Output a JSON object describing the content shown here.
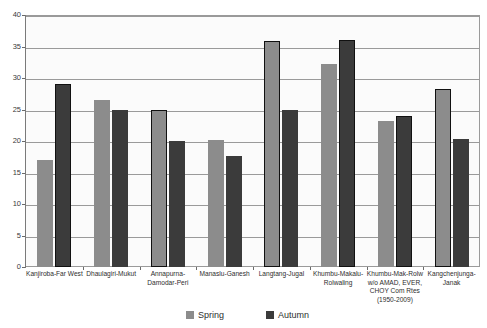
{
  "chart_data": {
    "type": "bar",
    "title": "",
    "subtitle": "",
    "xlabel": "",
    "ylabel": "",
    "ylim": [
      0,
      40
    ],
    "yticks": [
      0,
      5,
      10,
      15,
      20,
      25,
      30,
      35,
      40
    ],
    "ytick_labels": [
      "0",
      "5",
      "10",
      "15",
      "20",
      "25",
      "30",
      "35",
      "40"
    ],
    "grid": true,
    "legend_position": "bottom",
    "categories": [
      "Kanjiroba-Far West",
      "Dhaulagiri-Mukut",
      "Annapurna-Damodar-Peri",
      "Manaslu-Ganesh",
      "Langtang-Jugal",
      "Khumbu-Makalu-Rolwaling",
      "Khumbu-Mak-Rolw w/o AMAD, EVER, CHOY Com Rtes (1950-2009)",
      "Kangchenjunga-Janak"
    ],
    "category_label_lines": [
      [
        "Kanjiroba-Far West"
      ],
      [
        "Dhaulagiri-Mukut"
      ],
      [
        "Annapurna-",
        "Damodar-Peri"
      ],
      [
        "Manaslu-Ganesh"
      ],
      [
        "Langtang-Jugal"
      ],
      [
        "Khumbu-Makalu-",
        "Rolwaling"
      ],
      [
        "Khumbu-Mak-Rolw",
        "w/o AMAD, EVER,",
        "CHOY Com Rtes",
        "(1950-2009)"
      ],
      [
        "Kangchenjunga-",
        "Janak"
      ]
    ],
    "series": [
      {
        "name": "Spring",
        "color": "#8c8c8c",
        "values": [
          17,
          26.5,
          25,
          20.2,
          35.8,
          32.3,
          23.2,
          28.3
        ]
      },
      {
        "name": "Autumn",
        "color": "#3b3b3b",
        "values": [
          29.1,
          25,
          20,
          17.7,
          25,
          36,
          24,
          20.3
        ]
      }
    ]
  },
  "legend": {
    "items": [
      {
        "label": "Spring",
        "swatch": "spring-swatch"
      },
      {
        "label": "Autumn",
        "swatch": "autumn-swatch"
      }
    ]
  },
  "axis": {
    "y_tick_0": "0",
    "y_tick_5": "5",
    "y_tick_10": "10",
    "y_tick_15": "15",
    "y_tick_20": "20",
    "y_tick_25": "25",
    "y_tick_30": "30",
    "y_tick_35": "35",
    "y_tick_40": "40"
  }
}
